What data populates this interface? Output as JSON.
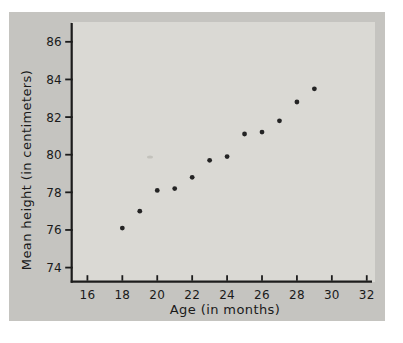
{
  "figure": {
    "page_bg": "#ffffff",
    "card_bg": "#c5c4c0",
    "plot_bg": "#dad9d4",
    "axis_color": "#1c1c1c",
    "text_color": "#1a1a1a",
    "point_color": "#242424",
    "smudge_color": "#c3c2bc"
  },
  "chart_data": {
    "type": "scatter",
    "title": "",
    "xlabel": "Age (in months)",
    "ylabel": "Mean height (in centimeters)",
    "x": [
      18,
      19,
      20,
      21,
      22,
      23,
      24,
      25,
      26,
      27,
      28,
      29
    ],
    "y": [
      76.1,
      77.0,
      78.1,
      78.2,
      78.8,
      79.7,
      79.9,
      81.1,
      81.2,
      81.8,
      82.8,
      83.5
    ],
    "xticks": [
      16,
      18,
      20,
      22,
      24,
      26,
      28,
      30,
      32
    ],
    "yticks": [
      74,
      76,
      78,
      80,
      82,
      84,
      86
    ],
    "xlim": [
      15.1,
      32.3
    ],
    "ylim": [
      73.25,
      87.0
    ],
    "grid": false,
    "legend": null,
    "marker": "dot"
  }
}
